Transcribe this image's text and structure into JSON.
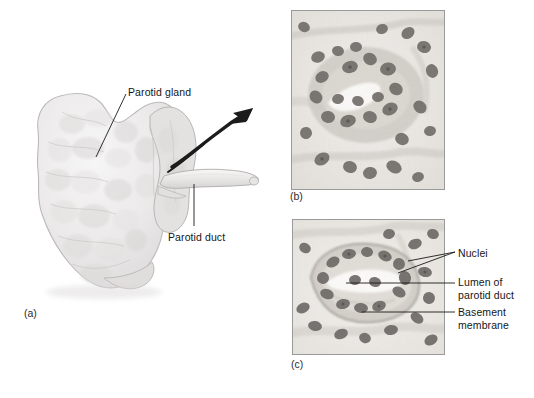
{
  "figure": {
    "kind": "anatomy-histology-figure",
    "background_color": "#ffffff",
    "ink_color": "#161616"
  },
  "panels": [
    {
      "id": "a",
      "tag": "(a)",
      "type": "illustration",
      "subject": "parotid gland and parotid duct",
      "labels": [
        {
          "id": "parotid-gland",
          "text": "Parotid gland"
        },
        {
          "id": "parotid-duct",
          "text": "Parotid duct"
        }
      ],
      "arrow": {
        "name": "magnification-arrow",
        "description": "curved arrow from gland to micrographs",
        "color": "#1c1c1c"
      }
    },
    {
      "id": "b",
      "tag": "(b)",
      "type": "micrograph",
      "subject": "parotid duct cross section, low magnification",
      "labels": []
    },
    {
      "id": "c",
      "tag": "(c)",
      "type": "micrograph",
      "subject": "parotid duct cross section, high magnification",
      "labels": [
        {
          "id": "nuclei",
          "text": "Nuclei"
        },
        {
          "id": "lumen-parotid-duct",
          "text": "Lumen of\nparotid duct"
        },
        {
          "id": "basement-membrane",
          "text": "Basement\nmembrane"
        }
      ]
    }
  ],
  "tags": {
    "a": "(a)",
    "b": "(b)",
    "c": "(c)"
  },
  "text": {
    "parotid_gland": "Parotid gland",
    "parotid_duct": "Parotid duct",
    "nuclei": "Nuclei",
    "lumen_of_parotid_duct": "Lumen of\nparotid duct",
    "basement_membrane": "Basement\nmembrane"
  },
  "colors": {
    "gland_fill": "#eceaea",
    "gland_outline": "#b9b6b6",
    "tissue_base": "#efece7",
    "nucleus": "#6b6b6b",
    "lumen": "#fbfaf8",
    "panel_border": "#9a9a9a",
    "leader_line": "#1a1a1a"
  }
}
